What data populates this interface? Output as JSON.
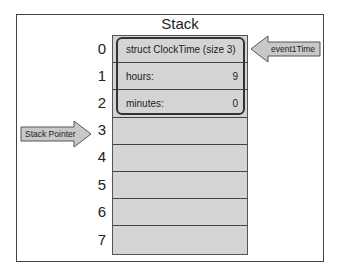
{
  "diagram": {
    "title": "Stack",
    "indices": [
      "0",
      "1",
      "2",
      "3",
      "4",
      "5",
      "6",
      "7"
    ],
    "struct": {
      "header": "struct ClockTime (size 3)",
      "fields": [
        {
          "name": "hours:",
          "value": "9"
        },
        {
          "name": "minutes:",
          "value": "0"
        }
      ]
    },
    "pointers": {
      "variable": "event1Time",
      "stack_pointer": "Stack Pointer"
    },
    "colors": {
      "cell_fill": "#d4d4d4",
      "arrow_fill": "#c8c8c8",
      "border": "#444444"
    }
  }
}
